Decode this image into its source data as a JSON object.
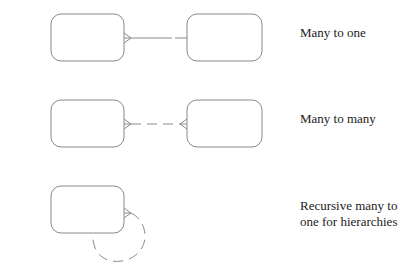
{
  "colors": {
    "stroke": "#8a8a8a",
    "text": "#222222",
    "background": "#ffffff"
  },
  "rows": [
    {
      "id": "many-to-one",
      "label": "Many to one",
      "left_end": "crows-foot",
      "right_end": "none",
      "line_style": "partial-dashed"
    },
    {
      "id": "many-to-many",
      "label": "Many to many",
      "left_end": "crows-foot",
      "right_end": "crows-foot",
      "line_style": "dashed"
    },
    {
      "id": "recursive",
      "label": "Recursive many to\none for hierarchies",
      "left_end": "crows-foot",
      "right_end": "none",
      "line_style": "dashed-arc"
    }
  ]
}
